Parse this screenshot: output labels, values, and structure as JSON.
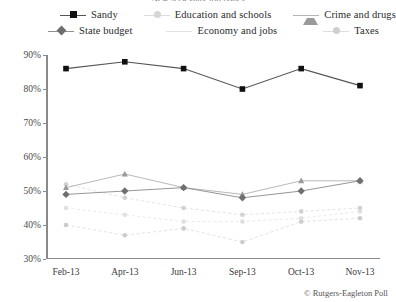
{
  "title": "New Jerseyans' top issues",
  "credit": "© Rutgers-Eagleton Poll",
  "legend": {
    "rows": [
      [
        {
          "label": "Sandy",
          "key": "sandy",
          "marker": "square",
          "color": "#111111",
          "line": "#555555"
        },
        {
          "label": "Education and schools",
          "key": "education",
          "marker": "dot",
          "color": "#d6d6d6",
          "line": "#dcdcdc"
        },
        {
          "label": "Crime and drugs",
          "key": "crime",
          "marker": "triangle",
          "color": "#9a9a9a",
          "line": "#b4b4b4"
        }
      ],
      [
        {
          "label": "State budget",
          "key": "budget",
          "marker": "diamond",
          "color": "#6f6f6f",
          "line": "#8f8f8f"
        },
        {
          "label": "Economy and jobs",
          "key": "economy",
          "marker": "none",
          "color": "#e2e2e2",
          "line": "#e2e2e2"
        },
        {
          "label": "Taxes",
          "key": "taxes",
          "marker": "dot",
          "color": "#cfcfcf",
          "line": "#dddddd"
        }
      ]
    ]
  },
  "chart_data": {
    "type": "line",
    "title": "New Jerseyans' top issues",
    "xlabel": "",
    "ylabel": "",
    "categories": [
      "Feb-13",
      "Apr-13",
      "Jun-13",
      "Sep-13",
      "Oct-13",
      "Nov-13"
    ],
    "ylim": [
      30,
      90
    ],
    "ytick_labels": [
      "30%",
      "40%",
      "50%",
      "60%",
      "70%",
      "80%",
      "90%"
    ],
    "ytick_values": [
      30,
      40,
      50,
      60,
      70,
      80,
      90
    ],
    "grid": false,
    "legend_position": "top",
    "value_suffix": "%",
    "series": [
      {
        "name": "Sandy",
        "key": "sandy",
        "marker": "square",
        "color": "#111111",
        "line_color": "#555555",
        "line_width": 1.1,
        "dashed": false,
        "values": [
          86,
          88,
          86,
          80,
          86,
          81
        ]
      },
      {
        "name": "Crime and drugs",
        "key": "crime",
        "marker": "triangle",
        "color": "#9a9a9a",
        "line_color": "#b0b0b0",
        "line_width": 0.9,
        "dashed": false,
        "values": [
          51,
          55,
          51,
          49,
          53,
          53
        ]
      },
      {
        "name": "State budget",
        "key": "budget",
        "marker": "diamond",
        "color": "#6f6f6f",
        "line_color": "#8a8a8a",
        "line_width": 0.9,
        "dashed": false,
        "values": [
          49,
          50,
          51,
          48,
          50,
          53
        ]
      },
      {
        "name": "Education and schools",
        "key": "education",
        "marker": "dot",
        "color": "#d2d2d2",
        "line_color": "#dcdcdc",
        "line_width": 0.8,
        "dashed": true,
        "values": [
          52,
          48,
          45,
          43,
          44,
          45
        ]
      },
      {
        "name": "Economy and jobs",
        "key": "economy",
        "marker": "dot",
        "color": "#e0e0e0",
        "line_color": "#e4e4e4",
        "line_width": 0.8,
        "dashed": true,
        "values": [
          45,
          43,
          41,
          41,
          42,
          44
        ]
      },
      {
        "name": "Taxes",
        "key": "taxes",
        "marker": "dot",
        "color": "#cccccc",
        "line_color": "#dadada",
        "line_width": 0.8,
        "dashed": true,
        "values": [
          40,
          37,
          39,
          35,
          41,
          42
        ]
      }
    ]
  }
}
